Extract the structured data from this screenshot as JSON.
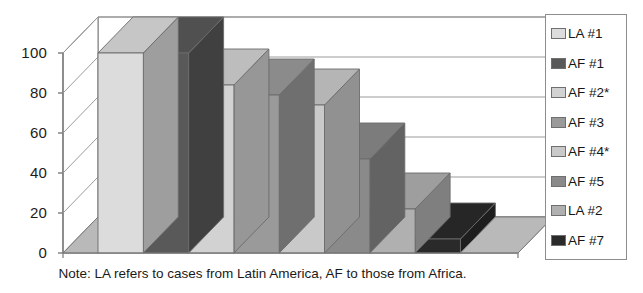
{
  "chart_data": {
    "type": "bar",
    "title": "",
    "subtitle": "",
    "xlabel": "",
    "ylabel": "",
    "ylim": [
      0,
      100
    ],
    "yticks": [
      0,
      20,
      40,
      60,
      80,
      100
    ],
    "grid": true,
    "three_d": true,
    "legend_position": "right",
    "categories": [
      "LA #1",
      "AF #1",
      "AF #2*",
      "AF #3",
      "AF #4*",
      "AF #5",
      "LA #2",
      "AF #7"
    ],
    "values": [
      100,
      100,
      84,
      79,
      74,
      47,
      22,
      7
    ],
    "series": [
      {
        "name": "cases",
        "values": [
          100,
          100,
          84,
          79,
          74,
          47,
          22,
          7
        ]
      }
    ],
    "bar_colors": [
      "#dcdcdc",
      "#595959",
      "#d2d2d2",
      "#9a9a9a",
      "#c9c9c9",
      "#8a8a8a",
      "#b0b0b0",
      "#2a2a2a"
    ],
    "annotations": [
      "Note: LA refers to cases from Latin America, AF to those from Africa."
    ]
  },
  "axis": {
    "y_ticks": [
      {
        "label": "100",
        "value": 100
      },
      {
        "label": "80",
        "value": 80
      },
      {
        "label": "60",
        "value": 60
      },
      {
        "label": "40",
        "value": 40
      },
      {
        "label": "20",
        "value": 20
      },
      {
        "label": "0",
        "value": 0
      }
    ]
  },
  "legend": {
    "items": [
      {
        "label": "LA #1",
        "swatch": "#dcdcdc"
      },
      {
        "label": "AF #1",
        "swatch": "#595959"
      },
      {
        "label": "AF #2*",
        "swatch": "#d2d2d2"
      },
      {
        "label": "AF #3",
        "swatch": "#9a9a9a"
      },
      {
        "label": "AF #4*",
        "swatch": "#c9c9c9"
      },
      {
        "label": "AF #5",
        "swatch": "#8a8a8a"
      },
      {
        "label": "LA #2",
        "swatch": "#b0b0b0"
      },
      {
        "label": "AF #7",
        "swatch": "#2a2a2a"
      }
    ]
  },
  "note": {
    "text": "Note: LA refers to cases from Latin America, AF to those from Africa."
  },
  "colors": {
    "axis_line": "#7a7a7a",
    "grid_line": "#9b9b9b",
    "bar_outline": "#6b6b6b",
    "floor": "#b9b9b9",
    "text": "#1a1a1a"
  }
}
